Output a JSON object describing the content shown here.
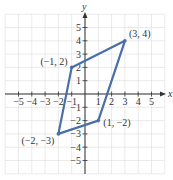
{
  "chart_data": {
    "type": "scatter",
    "title": "",
    "xlabel": "x",
    "ylabel": "y",
    "xlim": [
      -6,
      6
    ],
    "ylim": [
      -6,
      6
    ],
    "grid": true,
    "x_ticks": [
      -5,
      -4,
      -3,
      -2,
      -1,
      1,
      2,
      3,
      4,
      5
    ],
    "y_ticks": [
      -5,
      -4,
      -3,
      -2,
      -1,
      1,
      2,
      3,
      4,
      5
    ],
    "series": [
      {
        "name": "parallelogram",
        "closed": true,
        "color": "#4a6fa5",
        "points": [
          {
            "x": -1,
            "y": 2,
            "label": "(−1, 2)"
          },
          {
            "x": 3,
            "y": 4,
            "label": "(3, 4)"
          },
          {
            "x": 1,
            "y": -2,
            "label": "(1, −2)"
          },
          {
            "x": -2,
            "y": -3,
            "label": "(−2, −3)"
          }
        ]
      }
    ]
  },
  "axes": {
    "x_name": "x",
    "y_name": "y",
    "x_tick_labels": [
      "−5",
      "−4",
      "−3",
      "−2",
      "−1",
      "1",
      "2",
      "3",
      "4",
      "5"
    ],
    "y_tick_labels": [
      "5",
      "4",
      "3",
      "2",
      "1",
      "−1",
      "−2",
      "−3",
      "−4",
      "−5"
    ]
  },
  "colors": {
    "line": "#4a6fa5",
    "grid": "#dcdcdc",
    "axis": "#333333"
  }
}
